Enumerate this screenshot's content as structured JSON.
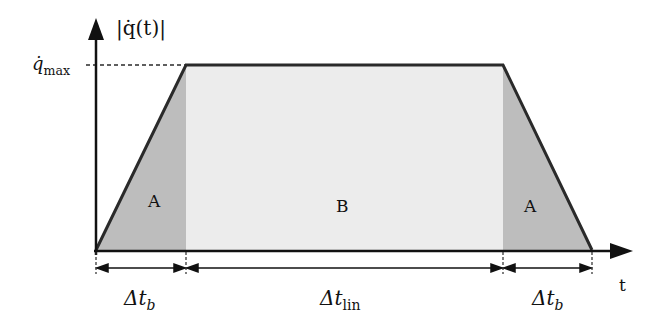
{
  "diagram": {
    "y_axis_label": "|q̇(t)|",
    "x_axis_label": "t",
    "ymax_label": "q̇",
    "ymax_sub": "max",
    "regions": [
      {
        "name": "A",
        "label": "A",
        "color": "#bdbdbd"
      },
      {
        "name": "B",
        "label": "B",
        "color": "#ececec"
      },
      {
        "name": "A",
        "label": "A",
        "color": "#bdbdbd"
      }
    ],
    "intervals": [
      {
        "label": "Δt",
        "sub": "b"
      },
      {
        "label": "Δt",
        "sub": "lin"
      },
      {
        "label": "Δt",
        "sub": "b"
      }
    ],
    "colors": {
      "line": "#2a2a2a",
      "dark_fill": "#bdbdbd",
      "light_fill": "#ececec"
    }
  }
}
